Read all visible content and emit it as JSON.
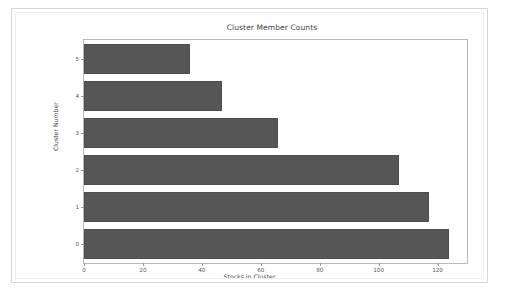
{
  "figure": {
    "title": "Cluster Member Counts",
    "background_color": "#ffffff",
    "border_color": "#d7d7d7"
  },
  "chart_data": {
    "type": "bar",
    "orientation": "horizontal",
    "title": "Cluster Member Counts",
    "xlabel": "Stocks in Cluster",
    "ylabel": "Cluster Number",
    "categories": [
      "0",
      "1",
      "2",
      "3",
      "4",
      "5"
    ],
    "values": [
      124,
      117,
      107,
      66,
      47,
      36
    ],
    "series": [
      {
        "name": "Stocks in Cluster",
        "values": [
          124,
          117,
          107,
          66,
          47,
          36
        ]
      }
    ],
    "xlim": [
      0,
      130
    ],
    "ylim": [
      -0.6,
      5.6
    ],
    "xticks": [
      0,
      20,
      40,
      60,
      80,
      100,
      120
    ],
    "xtick_labels": [
      "0",
      "20",
      "40",
      "60",
      "80",
      "100",
      "120"
    ],
    "yticks": [
      0,
      1,
      2,
      3,
      4,
      5
    ],
    "ytick_labels": [
      "0",
      "1",
      "2",
      "3",
      "4",
      "5"
    ],
    "grid": false,
    "legend": false,
    "bar_color": "#565656",
    "axes_color": "#b9b9b9"
  }
}
